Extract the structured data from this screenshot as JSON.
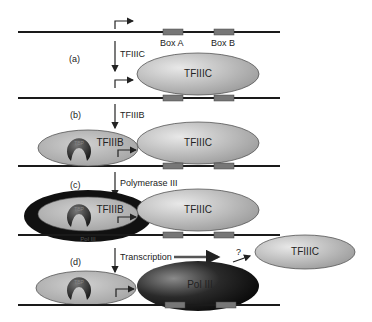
{
  "diagram": {
    "steps": [
      {
        "id": "a",
        "label": "(a)",
        "arrow_text": "TFIIIC"
      },
      {
        "id": "b",
        "label": "(b)",
        "arrow_text": "TFIIIB"
      },
      {
        "id": "c",
        "label": "(c)",
        "arrow_text": "Polymerase III"
      },
      {
        "id": "d",
        "label": "(d)",
        "arrow_text": "Transcription"
      }
    ],
    "boxes": {
      "a": "Box A",
      "b": "Box B"
    },
    "factors": {
      "tfiiic": "TFIIIC",
      "tfiiib": "TFIIIB",
      "tbp": "TBP",
      "pol3": "Pol III",
      "pol3_ring": "Pol III"
    },
    "question_mark": "?",
    "colors": {
      "dna": "#1a1a1a",
      "box": "#777777",
      "tfiiic_fill": "#b8b8b8",
      "tfiiib_fill": "#b0b0b0",
      "pol3_fill": "#222222",
      "tbp_fill": "#3a3a3a"
    }
  }
}
